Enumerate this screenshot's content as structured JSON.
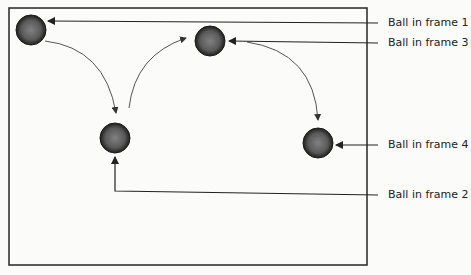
{
  "diagram": {
    "type": "ball-animation-frames",
    "colors": {
      "ball": "#3a3a3a",
      "ball_highlight": "#7a7a7a",
      "line": "#222222",
      "curve": "#555555",
      "background": "#fbfbfa"
    },
    "balls": [
      {
        "id": "frame-1",
        "label": "Ball in frame 1",
        "cx": 31,
        "cy": 30
      },
      {
        "id": "frame-2",
        "label": "Ball in frame 2",
        "cx": 115,
        "cy": 138
      },
      {
        "id": "frame-3",
        "label": "Ball in frame 3",
        "cx": 210,
        "cy": 41
      },
      {
        "id": "frame-4",
        "label": "Ball in frame 4",
        "cx": 318,
        "cy": 143
      }
    ],
    "labels": {
      "frame1": "Ball in frame 1",
      "frame3": "Ball in frame 3",
      "frame4": "Ball in frame 4",
      "frame2": "Ball in frame 2"
    }
  }
}
